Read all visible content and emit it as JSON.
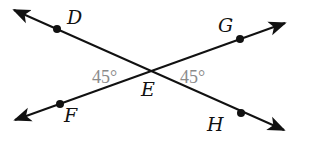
{
  "diagram": {
    "type": "intersecting-lines",
    "colors": {
      "line": "#111111",
      "point": "#111111",
      "angle_label": "#8a8a8a",
      "background": "#ffffff"
    },
    "intersection": {
      "label": "E",
      "x": 151,
      "y": 73
    },
    "lines": [
      {
        "name": "line-DH",
        "from": {
          "x": 14,
          "y": 10
        },
        "to": {
          "x": 284,
          "y": 130
        },
        "arrows": "both"
      },
      {
        "name": "line-FG",
        "from": {
          "x": 15,
          "y": 120
        },
        "to": {
          "x": 285,
          "y": 23
        },
        "arrows": "both"
      }
    ],
    "points": [
      {
        "label": "D",
        "x": 57,
        "y": 29
      },
      {
        "label": "G",
        "x": 240,
        "y": 39
      },
      {
        "label": "F",
        "x": 60,
        "y": 104
      },
      {
        "label": "H",
        "x": 241,
        "y": 113
      }
    ],
    "labels": {
      "D": "D",
      "G": "G",
      "E": "E",
      "F": "F",
      "H": "H"
    },
    "angles": [
      {
        "name": "angle-DEF",
        "text": "45°",
        "side": "left"
      },
      {
        "name": "angle-GEH",
        "text": "45°",
        "side": "right"
      }
    ]
  }
}
